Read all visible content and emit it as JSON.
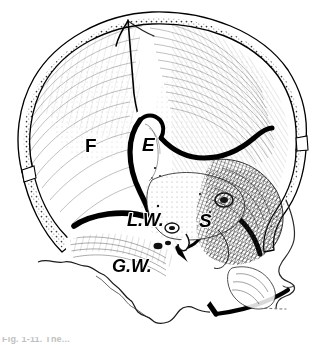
{
  "figure": {
    "kind": "anatomical-line-drawing",
    "background_color": "#ffffff",
    "ink_color": "#000000",
    "shading_color": "#4a4a4a",
    "labels": [
      {
        "id": "frontal",
        "text": "F",
        "x": 85,
        "y": 152,
        "size": 19,
        "italic": false
      },
      {
        "id": "ethmoid",
        "text": "E",
        "x": 142,
        "y": 151,
        "size": 19,
        "italic": true
      },
      {
        "id": "lesser-wing",
        "text": "L.W.",
        "x": 127,
        "y": 226,
        "size": 18,
        "italic": true
      },
      {
        "id": "sella",
        "text": "S",
        "x": 199,
        "y": 227,
        "size": 19,
        "italic": true
      },
      {
        "id": "greater-wing",
        "text": "G.W.",
        "x": 112,
        "y": 272,
        "size": 18,
        "italic": true
      }
    ],
    "caption": "Fig. 1-11. The..."
  }
}
